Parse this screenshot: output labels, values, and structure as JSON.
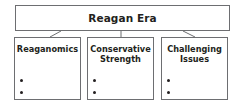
{
  "diagram": {
    "root": {
      "label": "Reagan Era"
    },
    "children": [
      {
        "label": "Reaganomics",
        "bullets": [
          "",
          ""
        ]
      },
      {
        "label": "Conservative\nStrength",
        "bullets": [
          "",
          ""
        ]
      },
      {
        "label": "Challenging\nIssues",
        "bullets": [
          "",
          ""
        ]
      }
    ],
    "colors": {
      "border": "#6d6e71",
      "text": "#231f20",
      "background": "#ffffff"
    }
  }
}
